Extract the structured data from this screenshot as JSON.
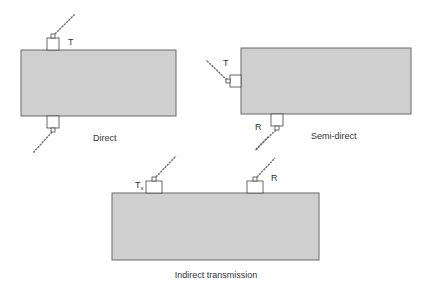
{
  "diagram": {
    "panels": [
      {
        "caption": "Direct",
        "transducers": [
          {
            "label": "T",
            "position": "top"
          },
          {
            "label": "",
            "position": "bottom"
          }
        ]
      },
      {
        "caption": "Semi-direct",
        "transducers": [
          {
            "label": "T",
            "position": "left"
          },
          {
            "label": "R",
            "position": "bottom"
          }
        ]
      },
      {
        "caption": "Indirect transmission",
        "transducers": [
          {
            "label": "T",
            "sub": "x",
            "position": "top-left"
          },
          {
            "label": "R",
            "position": "top-right"
          }
        ]
      }
    ],
    "colors": {
      "block_fill": "#cfcfcf",
      "block_stroke": "#6a6a6a",
      "line": "#444444"
    }
  }
}
